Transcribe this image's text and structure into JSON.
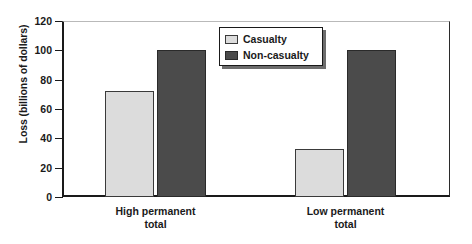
{
  "chart_data": {
    "type": "bar",
    "title": "",
    "xlabel": "",
    "ylabel": "Loss (billions of dollars)",
    "categories": [
      "High permanent\ntotal",
      "Low permanent\ntotal"
    ],
    "category_lines": [
      [
        "High permanent",
        "total"
      ],
      [
        "Low permanent",
        "total"
      ]
    ],
    "series": [
      {
        "name": "Casualty",
        "values": [
          72,
          100
        ],
        "color": "#dcdcdc"
      },
      {
        "name": "Non-casualty",
        "values": [
          33,
          100
        ],
        "color": "#4b4b4b"
      }
    ],
    "note_series_mapping": "group1 = [Casualty 72, Non-casualty 100]; group2 = [Casualty 33, Non-casualty 100]",
    "bars": [
      {
        "group": "High permanent total",
        "series": "Casualty",
        "value": 72
      },
      {
        "group": "High permanent total",
        "series": "Non-casualty",
        "value": 100
      },
      {
        "group": "Low permanent total",
        "series": "Casualty",
        "value": 33
      },
      {
        "group": "Low permanent total",
        "series": "Non-casualty",
        "value": 100
      }
    ],
    "ylim": [
      0,
      120
    ],
    "ytick_step": 20,
    "yticks": [
      0,
      20,
      40,
      60,
      80,
      100,
      120
    ],
    "ytick_labels": [
      "0",
      "20",
      "40",
      "60",
      "80",
      "100",
      "120"
    ],
    "grid": false,
    "legend_position": "top-center-right",
    "legend_entries": [
      {
        "label": "Casualty",
        "color": "#dcdcdc"
      },
      {
        "label": "Non-casualty",
        "color": "#4b4b4b"
      }
    ]
  }
}
